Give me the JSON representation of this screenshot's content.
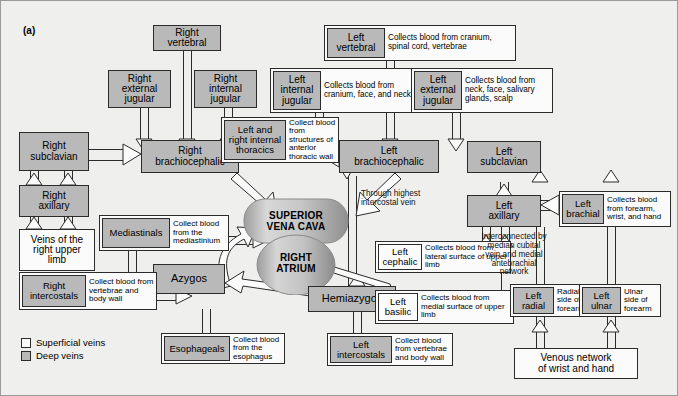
{
  "figure": {
    "panel_label": "(a)",
    "colors": {
      "deep_vein_fill": "#b9b9b9",
      "superficial_vein_fill": "#fbfbfb",
      "outline": "#2b2b2b",
      "background": "#efefed"
    }
  },
  "legend": {
    "items": [
      {
        "label": "Superficial veins",
        "swatch": "superficial"
      },
      {
        "label": "Deep veins",
        "swatch": "deep"
      }
    ]
  },
  "central": {
    "superior_vena_cava": "SUPERIOR\nVENA CAVA",
    "svc_line1": "SUPERIOR",
    "svc_line2": "VENA CAVA",
    "atrium_line1": "RIGHT",
    "atrium_line2": "ATRIUM"
  },
  "nodes": {
    "right_vertebral": {
      "label": "Right\nvertebral",
      "line1": "Right",
      "line2": "vertebral",
      "type": "deep"
    },
    "right_external_jugular": {
      "line1": "Right",
      "line2": "external",
      "line3": "jugular",
      "type": "deep"
    },
    "right_internal_jugular": {
      "line1": "Right",
      "line2": "internal",
      "line3": "jugular",
      "type": "deep"
    },
    "right_brachiocephalic": {
      "line1": "Right",
      "line2": "brachiocephalic",
      "type": "deep"
    },
    "right_subclavian": {
      "line1": "Right",
      "line2": "subclavian",
      "type": "deep"
    },
    "right_axillary": {
      "line1": "Right",
      "line2": "axillary",
      "type": "deep"
    },
    "veins_right_upper_limb": {
      "line1": "Veins of the",
      "line2": "right upper",
      "line3": "limb",
      "type": "superficial"
    },
    "left_brachiocephalic": {
      "line1": "Left",
      "line2": "brachiocephalic",
      "type": "deep"
    },
    "left_subclavian": {
      "line1": "Left",
      "line2": "subclavian",
      "type": "deep"
    },
    "left_axillary": {
      "line1": "Left",
      "line2": "axillary",
      "type": "deep"
    },
    "azygos": {
      "label": "Azygos",
      "type": "deep"
    },
    "hemiazygos": {
      "label": "Hemiazygos",
      "type": "deep"
    },
    "venous_network_wrist_hand": {
      "line1": "Venous network",
      "line2": "of wrist and hand",
      "type": "superficial"
    }
  },
  "combos": {
    "left_vertebral": {
      "name_line1": "Left",
      "name_line2": "vertebral",
      "desc": "Collects blood from cranium, spinal cord, vertebrae",
      "name_type": "deep"
    },
    "left_internal_jugular": {
      "name_line1": "Left",
      "name_line2": "internal",
      "name_line3": "jugular",
      "desc": "Collects blood from cranium, face, and neck",
      "name_type": "deep"
    },
    "left_external_jugular": {
      "name_line1": "Left",
      "name_line2": "external",
      "name_line3": "jugular",
      "desc": "Collects blood from neck, face, salivary glands, scalp",
      "name_type": "deep"
    },
    "internal_thoracics": {
      "name_line1": "Left and",
      "name_line2": "right internal",
      "name_line3": "thoracics",
      "desc": "Collect blood from structures of anterior thoracic wall",
      "name_type": "deep"
    },
    "mediastinals": {
      "name_line1": "Mediastinals",
      "desc": "Collect blood from the mediastinium",
      "name_type": "deep"
    },
    "right_intercostals": {
      "name_line1": "Right",
      "name_line2": "intercostals",
      "desc": "Collect blood from vertebrae and body wall",
      "name_type": "deep"
    },
    "esophageals": {
      "name_line1": "Esophageals",
      "desc": "Collect blood from the esophagus",
      "name_type": "deep"
    },
    "left_intercostals": {
      "name_line1": "Left",
      "name_line2": "intercostals",
      "desc": "Collect blood from vertebrae and body wall",
      "name_type": "deep"
    },
    "left_cephalic": {
      "name_line1": "Left",
      "name_line2": "cephalic",
      "desc": "Collects blood from lateral surface of upper limb",
      "name_type": "superficial"
    },
    "left_basilic": {
      "name_line1": "Left",
      "name_line2": "basilic",
      "desc": "Collects blood from medial surface of upper limb",
      "name_type": "superficial"
    },
    "left_brachial": {
      "name_line1": "Left",
      "name_line2": "brachial",
      "desc": "Collects blood from forearm, wrist, and hand",
      "name_type": "deep"
    },
    "left_radial": {
      "name_line1": "Left",
      "name_line2": "radial",
      "desc": "Radial side of forearm",
      "name_type": "deep"
    },
    "left_ulnar": {
      "name_line1": "Left",
      "name_line2": "ulnar",
      "desc": "Ulnar side of forearm",
      "name_type": "deep"
    }
  },
  "annotations": {
    "highest_intercostal": {
      "line1": "Through highest",
      "line2": "intercostal vein"
    },
    "interconnected": {
      "line1": "Interconnected by",
      "line2": "median cubital",
      "line3": "vein and medial",
      "line4": "antebrachial",
      "line5": "network"
    }
  }
}
